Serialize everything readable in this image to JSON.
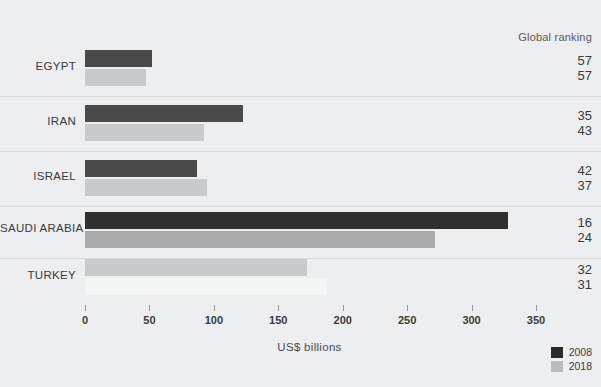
{
  "ranking_header": "Global ranking",
  "axis_title": "US$  billions",
  "legend": [
    {
      "label": "2008",
      "color": "#2b2b2b"
    },
    {
      "label": "2018",
      "color": "#b9bbbd"
    }
  ],
  "colors": {
    "background": "#edeeef",
    "bar_2008": "#4a4a4a",
    "bar_2018": "#c8cacb",
    "divider": "#d7d9da",
    "text": "#3a3a3a"
  },
  "chart_data": {
    "type": "bar",
    "orientation": "horizontal",
    "title": "",
    "xlabel": "US$  billions",
    "ylabel": "",
    "xlim": [
      0,
      350
    ],
    "ticks": [
      0,
      50,
      100,
      150,
      200,
      250,
      300,
      350
    ],
    "grid": false,
    "legend_position": "bottom-right",
    "categories": [
      "EGYPT",
      "IRAN",
      "ISRAEL",
      "SAUDI ARABIA",
      "TURKEY"
    ],
    "series": [
      {
        "name": "2008",
        "color": "#4a4a4a",
        "values": [
          52,
          123,
          87,
          328,
          172
        ]
      },
      {
        "name": "2018",
        "color": "#c8cacb",
        "values": [
          47,
          92,
          95,
          272,
          188
        ]
      }
    ],
    "annotations": {
      "header": "Global ranking",
      "rankings": [
        {
          "category": "EGYPT",
          "2008": "57",
          "2018": "57"
        },
        {
          "category": "IRAN",
          "2008": "35",
          "2018": "43"
        },
        {
          "category": "ISRAEL",
          "2008": "42",
          "2018": "37"
        },
        {
          "category": "SAUDI ARABIA",
          "2008": "16",
          "2018": "24"
        },
        {
          "category": "TURKEY",
          "2008": "32",
          "2018": "31"
        }
      ]
    }
  },
  "rows": [
    {
      "label": "EGYPT",
      "v2008": 52,
      "v2018": 47,
      "r2008": "57",
      "r2018": "57",
      "c2008": "#4a4a4a",
      "c2018": "#c8cacb",
      "top": 48,
      "divider": 96
    },
    {
      "label": "IRAN",
      "v2008": 123,
      "v2018": 92,
      "r2008": "35",
      "r2018": "43",
      "c2008": "#4a4a4a",
      "c2018": "#c8cacb",
      "top": 103,
      "divider": 151
    },
    {
      "label": "ISRAEL",
      "v2008": 87,
      "v2018": 95,
      "r2008": "42",
      "r2018": "37",
      "c2008": "#4a4a4a",
      "c2018": "#c8cacb",
      "top": 158,
      "divider": 206
    },
    {
      "label": "SAUDI ARABIA",
      "v2008": 328,
      "v2018": 272,
      "r2008": "16",
      "r2018": "24",
      "c2008": "#2f2f2f",
      "c2018": "#a9abad",
      "top": 210,
      "divider": 258
    },
    {
      "label": "TURKEY",
      "v2008": 172,
      "v2018": 188,
      "r2008": "32",
      "r2018": "31",
      "c2008": "#c8cacb",
      "c2018": "#f4f5f5",
      "top": 257,
      "divider": null
    }
  ]
}
